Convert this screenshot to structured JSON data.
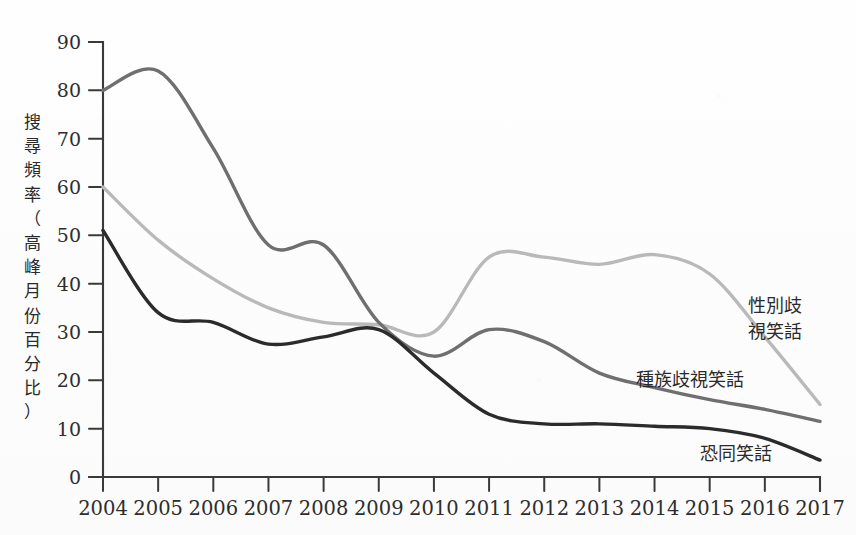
{
  "chart_data": {
    "type": "line",
    "title": "",
    "subtitle": "",
    "xlabel": "",
    "ylabel": "搜尋頻率（高峰月份百分比）",
    "ylabel_chars": [
      "搜",
      "尋",
      "頻",
      "率",
      "（",
      "高",
      "峰",
      "月",
      "份",
      "百",
      "分",
      "比",
      "）"
    ],
    "x": [
      2004,
      2005,
      2006,
      2007,
      2008,
      2009,
      2010,
      2011,
      2012,
      2013,
      2014,
      2015,
      2016,
      2017
    ],
    "categories": [
      "2004",
      "2005",
      "2006",
      "2007",
      "2008",
      "2009",
      "2010",
      "2011",
      "2012",
      "2013",
      "2014",
      "2015",
      "2016",
      "2017"
    ],
    "xlim": [
      2004,
      2017
    ],
    "ylim": [
      0,
      90
    ],
    "yticks": [
      0,
      10,
      20,
      30,
      40,
      50,
      60,
      70,
      80,
      90
    ],
    "ytick_labels": [
      "0",
      "10",
      "20",
      "30",
      "40",
      "50",
      "60",
      "70",
      "80",
      "90"
    ],
    "grid": false,
    "legend": "inline-labels",
    "legend_position": "right-of-curves",
    "series": [
      {
        "name": "性別歧視笑話",
        "label": "性別歧視笑話",
        "label_lines": [
          "性別歧",
          "視笑話"
        ],
        "color": "#b9b9b9",
        "stroke_width": 3.4,
        "values": [
          60,
          49,
          41,
          35,
          32,
          31.5,
          30,
          45.5,
          45.5,
          44,
          46,
          42,
          29,
          15
        ]
      },
      {
        "name": "種族歧視笑話",
        "label": "種族歧視笑話",
        "label_lines": [
          "種族歧視笑話"
        ],
        "color": "#6f6f6f",
        "stroke_width": 3.4,
        "values": [
          80,
          84,
          68,
          48,
          48,
          32,
          25,
          30.5,
          28,
          21.5,
          18.5,
          16,
          14,
          11.5
        ]
      },
      {
        "name": "恐同笑話",
        "label": "恐同笑話",
        "label_lines": [
          "恐同笑話"
        ],
        "color": "#2b2b2b",
        "stroke_width": 3.4,
        "values": [
          51,
          34,
          32,
          27.5,
          29,
          30.5,
          21.5,
          13,
          11,
          11,
          10.5,
          10,
          8,
          3.5
        ]
      }
    ],
    "annotations": [
      {
        "text": "性別歧視笑話",
        "for_series": "性別歧視笑話"
      },
      {
        "text": "種族歧視笑話",
        "for_series": "種族歧視笑話"
      },
      {
        "text": "恐同笑話",
        "for_series": "恐同笑話"
      }
    ],
    "colors": {
      "axis": "#3a3a3a",
      "background": "#fdfdfd",
      "text": "#2e2e2e"
    }
  }
}
